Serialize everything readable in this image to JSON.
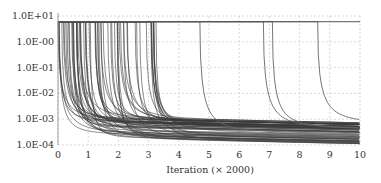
{
  "chart_data": {
    "type": "line",
    "title": "",
    "xlabel": "Iteration (× 2000)",
    "ylabel": "",
    "yscale": "log",
    "xlim": [
      0,
      10
    ],
    "ylim": [
      0.0001,
      10
    ],
    "grid": true,
    "legend": null,
    "x_ticks": [
      "0",
      "1",
      "2",
      "3",
      "4",
      "5",
      "6",
      "7",
      "8",
      "9",
      "10"
    ],
    "y_ticks": [
      "1.0E+01",
      "1.0E-00",
      "1.0E-01",
      "1.0E-02",
      "1.0E-03",
      "1.0E-04"
    ],
    "plateau_value": 6.0,
    "series_summary": {
      "count_approx": 70,
      "switch_points_early": "dense between 0 and 3.6",
      "late_switch_points": [
        4.7,
        6.8,
        7.1,
        8.6
      ],
      "final_values_range": [
        0.0002,
        0.0015
      ],
      "latest_curve_final_value": 0.0015
    }
  },
  "plot": {
    "left": 58,
    "right": 360,
    "top": 16,
    "bottom": 145,
    "line_color": "#3a3a3a",
    "grid_color": "#c8c8c8"
  }
}
